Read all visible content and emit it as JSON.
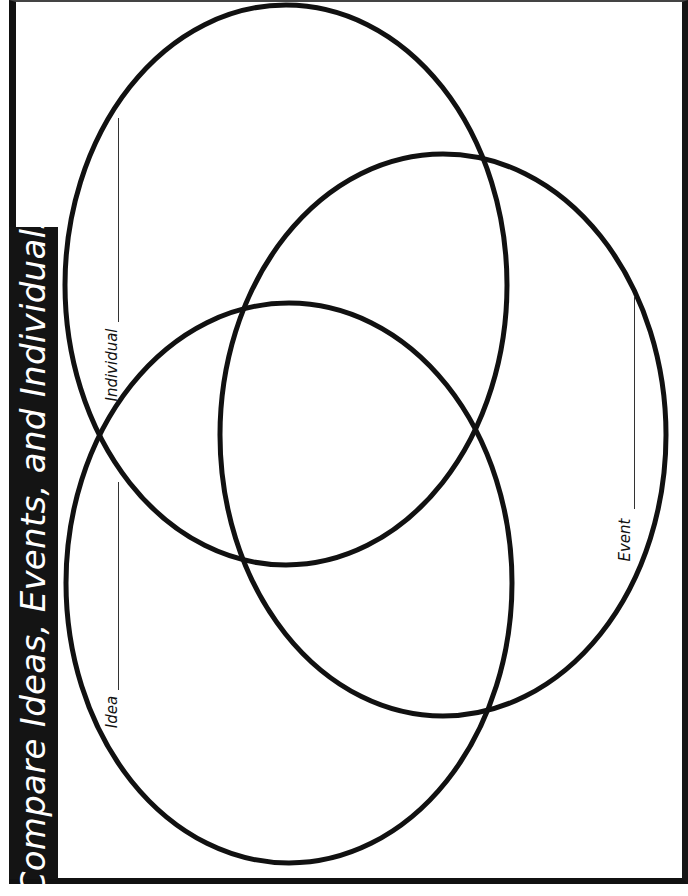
{
  "title": "Compare Ideas, Events, and Individuals",
  "circles": [
    {
      "name": "individual",
      "label": "Individual",
      "cx": 286,
      "cy": 285,
      "rx": 221,
      "ry": 280
    },
    {
      "name": "idea",
      "label": "Idea",
      "cx": 289,
      "cy": 583,
      "rx": 223,
      "ry": 280
    },
    {
      "name": "event",
      "label": "Event",
      "cx": 443,
      "cy": 435,
      "rx": 223,
      "ry": 281
    }
  ],
  "labels": {
    "individual": "Individual",
    "idea": "Idea",
    "event": "Event"
  },
  "colors": {
    "ink": "#111111",
    "title_band": "#141414",
    "title_text": "#ffffff",
    "paper": "#ffffff"
  }
}
